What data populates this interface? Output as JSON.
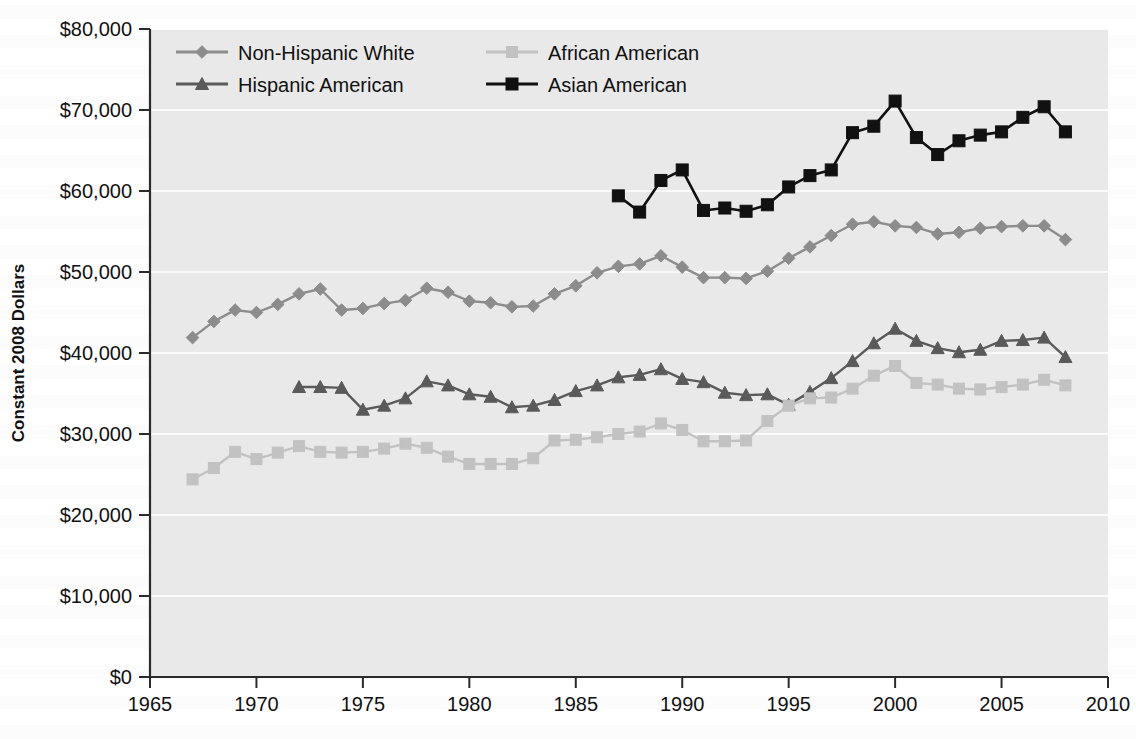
{
  "chart_data": {
    "type": "line",
    "title": "",
    "xlabel": "",
    "ylabel": "Constant 2008 Dollars",
    "xlim": [
      1965,
      2010
    ],
    "ylim": [
      0,
      80000
    ],
    "xticks": [
      "1965",
      "1970",
      "1975",
      "1980",
      "1985",
      "1990",
      "1995",
      "2000",
      "2005",
      "2010"
    ],
    "yticks": [
      "$0",
      "$10,000",
      "$20,000",
      "$30,000",
      "$40,000",
      "$50,000",
      "$60,000",
      "$70,000",
      "$80,000"
    ],
    "grid": true,
    "legend_position": "top-left-inside",
    "series": [
      {
        "name": "Non-Hispanic White",
        "marker": "diamond",
        "color": "#8c8c8c",
        "x": [
          1967,
          1968,
          1969,
          1970,
          1971,
          1972,
          1973,
          1974,
          1975,
          1976,
          1977,
          1978,
          1979,
          1980,
          1981,
          1982,
          1983,
          1984,
          1985,
          1986,
          1987,
          1988,
          1989,
          1990,
          1991,
          1992,
          1993,
          1994,
          1995,
          1996,
          1997,
          1998,
          1999,
          2000,
          2001,
          2002,
          2003,
          2004,
          2005,
          2006,
          2007,
          2008
        ],
        "values": [
          41900,
          43900,
          45300,
          45000,
          46000,
          47300,
          47900,
          45300,
          45500,
          46100,
          46500,
          48000,
          47500,
          46400,
          46200,
          45700,
          45800,
          47300,
          48300,
          49900,
          50700,
          51000,
          52000,
          50600,
          49300,
          49300,
          49200,
          50100,
          51700,
          53100,
          54500,
          55900,
          56200,
          55700,
          55500,
          54700,
          54900,
          55400,
          55600,
          55700,
          55700,
          54000
        ]
      },
      {
        "name": "Hispanic American",
        "marker": "triangle",
        "color": "#5a5a5a",
        "x": [
          1972,
          1973,
          1974,
          1975,
          1976,
          1977,
          1978,
          1979,
          1980,
          1981,
          1982,
          1983,
          1984,
          1985,
          1986,
          1987,
          1988,
          1989,
          1990,
          1991,
          1992,
          1993,
          1994,
          1995,
          1996,
          1997,
          1998,
          1999,
          2000,
          2001,
          2002,
          2003,
          2004,
          2005,
          2006,
          2007,
          2008
        ],
        "values": [
          35800,
          35800,
          35700,
          33000,
          33500,
          34400,
          36500,
          36000,
          34900,
          34600,
          33300,
          33500,
          34200,
          35300,
          36000,
          37000,
          37300,
          38000,
          36800,
          36400,
          35100,
          34800,
          34900,
          33600,
          35200,
          36900,
          39000,
          41200,
          43000,
          41500,
          40600,
          40100,
          40400,
          41500,
          41600,
          41900,
          39500
        ]
      },
      {
        "name": "African American",
        "marker": "square",
        "color": "#c2c2c2",
        "x": [
          1967,
          1968,
          1969,
          1970,
          1971,
          1972,
          1973,
          1974,
          1975,
          1976,
          1977,
          1978,
          1979,
          1980,
          1981,
          1982,
          1983,
          1984,
          1985,
          1986,
          1987,
          1988,
          1989,
          1990,
          1991,
          1992,
          1993,
          1994,
          1995,
          1996,
          1997,
          1998,
          1999,
          2000,
          2001,
          2002,
          2003,
          2004,
          2005,
          2006,
          2007,
          2008
        ],
        "values": [
          24400,
          25800,
          27800,
          26900,
          27700,
          28500,
          27800,
          27700,
          27800,
          28200,
          28800,
          28300,
          27200,
          26300,
          26300,
          26300,
          27000,
          29200,
          29300,
          29600,
          30000,
          30300,
          31300,
          30500,
          29100,
          29100,
          29200,
          31600,
          33500,
          34400,
          34500,
          35600,
          37200,
          38400,
          36300,
          36100,
          35600,
          35500,
          35800,
          36100,
          36700,
          36000
        ]
      },
      {
        "name": "Asian American",
        "marker": "square",
        "color": "#111111",
        "x": [
          1987,
          1988,
          1989,
          1990,
          1991,
          1992,
          1993,
          1994,
          1995,
          1996,
          1997,
          1998,
          1999,
          2000,
          2001,
          2002,
          2003,
          2004,
          2005,
          2006,
          2007,
          2008
        ],
        "values": [
          59400,
          57400,
          61300,
          62600,
          57600,
          57900,
          57500,
          58300,
          60500,
          61900,
          62600,
          67200,
          68000,
          71100,
          66600,
          64500,
          66200,
          66900,
          67300,
          69100,
          70400,
          67300
        ]
      }
    ]
  },
  "axis": {
    "ylabel": "Constant 2008 Dollars"
  },
  "legend": {
    "entries": [
      {
        "label": "Non-Hispanic White"
      },
      {
        "label": "African American"
      },
      {
        "label": "Hispanic American"
      },
      {
        "label": "Asian American"
      }
    ]
  }
}
